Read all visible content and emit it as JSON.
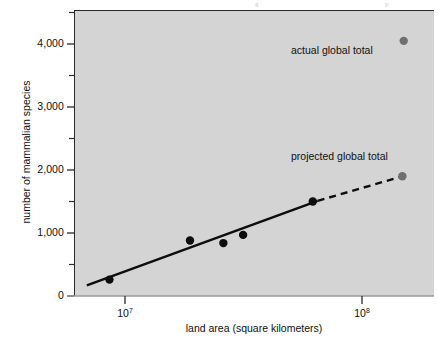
{
  "figure": {
    "background_color": "#ffffff",
    "panel_color": "#d4d4d4",
    "axis_color": "#2b2b2b"
  },
  "top_artifacts": {
    "left_mark": "g",
    "right_mark": "p"
  },
  "axes": {
    "x": {
      "title": "land area (square kilometers)",
      "scale": "log",
      "tick_labels": [
        "10",
        "10"
      ],
      "tick_exponents": [
        "7",
        "8"
      ],
      "tick_values": [
        10000000,
        100000000
      ],
      "range": [
        6000000,
        190000000
      ]
    },
    "y": {
      "title": "number of mammalian species",
      "scale": "linear",
      "tick_labels": [
        "0",
        "1,000",
        "2,000",
        "3,000",
        "4,000"
      ],
      "tick_values": [
        0,
        1000,
        2000,
        3000,
        4000
      ],
      "minor_tick_values": [
        500,
        1500,
        2500,
        3500,
        4500
      ],
      "range": [
        0,
        4450
      ]
    }
  },
  "annotations": {
    "actual_total": "actual global total",
    "projected_total": "projected global total"
  },
  "chart_data": {
    "type": "scatter",
    "title": "",
    "xlabel": "land area (square kilometers)",
    "ylabel": "number of mammalian species",
    "xscale": "log",
    "xlim": [
      6000000,
      190000000
    ],
    "ylim": [
      0,
      4450
    ],
    "grid": false,
    "legend": "none",
    "series": [
      {
        "name": "regional surveys",
        "marker": "filled-circle",
        "color": "#0d0d0d",
        "points": [
          {
            "x": 8600000,
            "y": 260
          },
          {
            "x": 18800000,
            "y": 880
          },
          {
            "x": 26000000,
            "y": 840
          },
          {
            "x": 31500000,
            "y": 970
          },
          {
            "x": 62000000,
            "y": 1500
          }
        ]
      },
      {
        "name": "projected global total",
        "marker": "filled-circle",
        "color": "#6f6f6f",
        "points": [
          {
            "x": 148000000,
            "y": 1900
          }
        ]
      },
      {
        "name": "actual global total",
        "marker": "filled-circle",
        "color": "#6f6f6f",
        "points": [
          {
            "x": 150000000,
            "y": 4050
          }
        ]
      }
    ],
    "fit_line": {
      "name": "log-linear regression",
      "style": "solid",
      "color": "#0d0d0d",
      "endpoints": [
        {
          "x": 6900000,
          "y": 170
        },
        {
          "x": 65000000,
          "y": 1510
        }
      ]
    },
    "extrapolation_line": {
      "name": "extrapolation to global land area",
      "style": "dashed",
      "color": "#0d0d0d",
      "endpoints": [
        {
          "x": 65000000,
          "y": 1510
        },
        {
          "x": 148000000,
          "y": 1900
        }
      ]
    }
  }
}
